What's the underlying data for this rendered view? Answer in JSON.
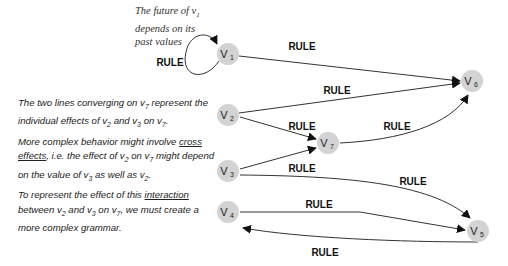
{
  "nodes": [
    {
      "id": "v1",
      "label": "V",
      "sub": "1",
      "x": 228,
      "y": 54
    },
    {
      "id": "v2",
      "label": "V",
      "sub": "2",
      "x": 228,
      "y": 115
    },
    {
      "id": "v3",
      "label": "V",
      "sub": "3",
      "x": 228,
      "y": 171
    },
    {
      "id": "v4",
      "label": "V",
      "sub": "4",
      "x": 228,
      "y": 212
    },
    {
      "id": "v5",
      "label": "V",
      "sub": "5",
      "x": 478,
      "y": 231
    },
    {
      "id": "v6",
      "label": "V",
      "sub": "6",
      "x": 472,
      "y": 81
    },
    {
      "id": "v7",
      "label": "V",
      "sub": "7",
      "x": 328,
      "y": 143
    }
  ],
  "edges": [
    {
      "from": "v1",
      "to": "v1",
      "label": "RULE"
    },
    {
      "from": "v1",
      "to": "v6",
      "label": "RULE"
    },
    {
      "from": "v2",
      "to": "v6",
      "label": "RULE"
    },
    {
      "from": "v2",
      "to": "v7",
      "label": "RULE"
    },
    {
      "from": "v3",
      "to": "v7",
      "label": "RULE"
    },
    {
      "from": "v7",
      "to": "v6",
      "label": "RULE"
    },
    {
      "from": "v3",
      "to": "v5",
      "label": "RULE"
    },
    {
      "from": "v4",
      "to": "v5",
      "label": "RULE"
    },
    {
      "from": "v5",
      "to": "v4",
      "label": "RULE"
    }
  ],
  "annotation_top": {
    "line1_a": "The future of v",
    "line1_sub": "1",
    "line2": "depends on its",
    "line3": "past values"
  },
  "notes": {
    "p1_a": "The two lines converging on v",
    "p1_s1": "7",
    "p1_b": " represent the individual effects of v",
    "p1_s2": "2",
    "p1_c": " and v",
    "p1_s3": "3",
    "p1_d": " on v",
    "p1_s4": "7",
    "p1_e": ".",
    "p2_a": "More complex behavior might involve ",
    "p2_u": "cross effects",
    "p2_b": ", i.e. the effect of v",
    "p2_s1": "2",
    "p2_c": " on v",
    "p2_s2": "7",
    "p2_d": " might depend on the value of v",
    "p2_s3": "3",
    "p2_e": " as well as v",
    "p2_s4": "2",
    "p2_f": ".",
    "p3_a": "To represent the effect of this ",
    "p3_u": "interaction",
    "p3_b": " between v",
    "p3_s1": "2",
    "p3_c": " and v",
    "p3_s2": "3",
    "p3_d": "  on v",
    "p3_s3": "7",
    "p3_e": ", we must create a more complex grammar."
  }
}
